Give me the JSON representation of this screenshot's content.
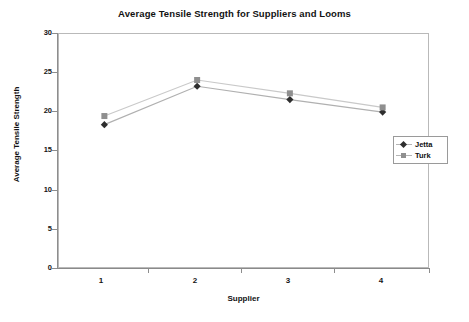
{
  "chart_data": {
    "type": "line",
    "title": "Average Tensile Strength for Suppliers and Looms",
    "xlabel": "Supplier",
    "ylabel": "Average Tensile Strength",
    "categories": [
      "1",
      "2",
      "3",
      "4"
    ],
    "xtick_labels": [
      "1",
      "2",
      "3",
      "4"
    ],
    "ytick_labels": [
      "0",
      "5",
      "10",
      "15",
      "20",
      "25",
      "30"
    ],
    "yticks": [
      0,
      5,
      10,
      15,
      20,
      25,
      30
    ],
    "ylim": [
      0,
      30
    ],
    "grid": false,
    "legend_position": "right",
    "series": [
      {
        "name": "Jetta",
        "marker": "diamond",
        "marker_color": "#2e2e2e",
        "line_color": "#b0b0b0",
        "values": [
          18.3,
          23.2,
          21.5,
          19.9
        ]
      },
      {
        "name": "Turk",
        "marker": "square",
        "marker_color": "#8f8f8f",
        "line_color": "#c9c9c9",
        "values": [
          19.4,
          24.0,
          22.3,
          20.5
        ]
      }
    ]
  },
  "legend": {
    "entries": [
      {
        "label": "Jetta"
      },
      {
        "label": "Turk"
      }
    ]
  },
  "colors": {
    "background": "#ffffff",
    "axis": "#8d8d8d",
    "plot_border": "#b9b9b9",
    "text": "#121212",
    "jetta_marker": "#2e2e2e",
    "turk_marker": "#8f8f8f"
  }
}
